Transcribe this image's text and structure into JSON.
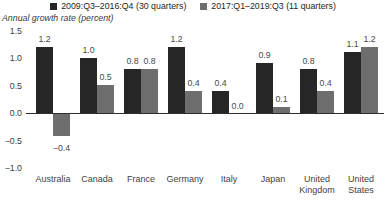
{
  "chart_data": {
    "type": "bar",
    "title": "",
    "axis_title": "Annual growth rate (percent)",
    "categories": [
      "Australia",
      "Canada",
      "France",
      "Germany",
      "Italy",
      "Japan",
      "United Kingdom",
      "United States"
    ],
    "series": [
      {
        "name": "2009:Q3–2016:Q4 (30 quarters)",
        "color": "#262626",
        "values": [
          1.2,
          1.0,
          0.8,
          1.2,
          0.4,
          0.9,
          0.8,
          1.1
        ]
      },
      {
        "name": "2017:Q1–2019:Q3 (11 quarters)",
        "color": "#6e6e6e",
        "values": [
          -0.4,
          0.5,
          0.8,
          0.4,
          0.0,
          0.1,
          0.4,
          1.2
        ]
      }
    ],
    "ylim": [
      -1.0,
      1.5
    ],
    "yticks": [
      1.5,
      1.0,
      0.5,
      0.0,
      -0.5,
      -1.0
    ],
    "legend_position": "top",
    "grid": false,
    "value_labels": true,
    "colors": {
      "value_label": "#4a4a4a",
      "tick_label": "#404040",
      "axis_line": "#2e2e2e",
      "background": "#ffffff"
    }
  }
}
